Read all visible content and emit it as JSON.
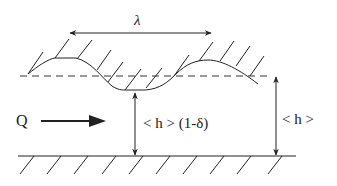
{
  "diagram": {
    "labels": {
      "wavelength": "λ",
      "flow": "Q",
      "min_gap": "< h > (1-δ)",
      "mean_gap": "< h >"
    },
    "elements": {
      "upper_wall": "sinusoidal wall with hatching",
      "mean_line": "dashed reference line",
      "lower_wall": "flat wall with hatching"
    },
    "colors": {
      "stroke": "#222222",
      "background": "#ffffff"
    }
  }
}
